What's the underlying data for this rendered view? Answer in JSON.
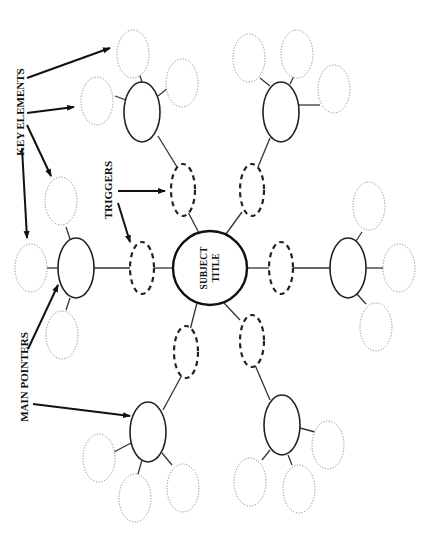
{
  "diagram": {
    "type": "spider-mind-map",
    "orientation": "rotated-90-ccw",
    "center": {
      "label_line1": "SUBJECT",
      "label_line2": "TITLE"
    },
    "annotations": {
      "key_elements": "KEY ELEMENTS",
      "triggers": "TRIGGERS",
      "main_pointers": "MAIN POINTERS"
    },
    "branches": [
      {
        "id": "upper-left",
        "main_pointer": "",
        "trigger": "",
        "key_elements": [
          "",
          "",
          ""
        ]
      },
      {
        "id": "upper-right",
        "main_pointer": "",
        "trigger": "",
        "key_elements": [
          "",
          "",
          ""
        ]
      },
      {
        "id": "left",
        "main_pointer": "",
        "trigger": "",
        "key_elements": [
          "",
          "",
          ""
        ]
      },
      {
        "id": "right",
        "main_pointer": "",
        "trigger": "",
        "key_elements": [
          "",
          "",
          ""
        ]
      },
      {
        "id": "lower-left",
        "main_pointer": "",
        "trigger": "",
        "key_elements": [
          "",
          "",
          ""
        ]
      },
      {
        "id": "lower-right",
        "main_pointer": "",
        "trigger": "",
        "key_elements": [
          "",
          "",
          ""
        ]
      }
    ],
    "legend": {
      "subject_title": "solid bold circle",
      "triggers": "dashed ovals",
      "main_pointers": "solid ovals",
      "key_elements": "dotted ovals"
    }
  }
}
